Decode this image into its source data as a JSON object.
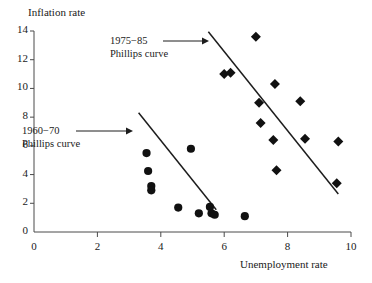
{
  "chart_data": {
    "type": "scatter",
    "title": "",
    "xlabel": "Unemployment rate",
    "ylabel": "Inflation rate",
    "xlim": [
      0,
      10
    ],
    "ylim": [
      0,
      14
    ],
    "xticks": [
      0,
      2,
      4,
      6,
      8,
      10
    ],
    "yticks": [
      0,
      2,
      4,
      6,
      8,
      10,
      12,
      14
    ],
    "xtick_labels": [
      "0",
      "2",
      "4",
      "6",
      "8",
      "10"
    ],
    "ytick_labels": [
      "0",
      "2",
      "4",
      "6",
      "8",
      "10",
      "12",
      "14"
    ],
    "grid": false,
    "legend": "none",
    "series": [
      {
        "name": "1960-70",
        "marker": "circle",
        "color": "#111111",
        "points": [
          {
            "x": 3.55,
            "y": 5.5
          },
          {
            "x": 3.6,
            "y": 4.25
          },
          {
            "x": 3.7,
            "y": 3.2
          },
          {
            "x": 3.7,
            "y": 2.9
          },
          {
            "x": 4.55,
            "y": 1.7
          },
          {
            "x": 4.95,
            "y": 5.8
          },
          {
            "x": 5.2,
            "y": 1.3
          },
          {
            "x": 5.55,
            "y": 1.75
          },
          {
            "x": 5.6,
            "y": 1.3
          },
          {
            "x": 5.7,
            "y": 1.2
          },
          {
            "x": 6.65,
            "y": 1.1
          }
        ]
      },
      {
        "name": "1975-85",
        "marker": "diamond",
        "color": "#111111",
        "points": [
          {
            "x": 6.0,
            "y": 11.0
          },
          {
            "x": 6.2,
            "y": 11.1
          },
          {
            "x": 7.0,
            "y": 13.6
          },
          {
            "x": 7.1,
            "y": 9.0
          },
          {
            "x": 7.15,
            "y": 7.6
          },
          {
            "x": 7.55,
            "y": 6.4
          },
          {
            "x": 7.6,
            "y": 10.3
          },
          {
            "x": 7.65,
            "y": 4.3
          },
          {
            "x": 8.4,
            "y": 9.1
          },
          {
            "x": 8.55,
            "y": 6.5
          },
          {
            "x": 9.6,
            "y": 6.3
          },
          {
            "x": 9.55,
            "y": 3.4
          }
        ]
      }
    ],
    "trend_lines": [
      {
        "name": "1960-70 Phillips curve",
        "x1": 3.3,
        "y1": 8.3,
        "x2": 5.75,
        "y2": 1.55
      },
      {
        "name": "1975-85 Phillips curve",
        "x1": 5.5,
        "y1": 13.95,
        "x2": 9.6,
        "y2": 2.65
      }
    ],
    "annotations": [
      {
        "name": "annotation-1975-85",
        "line1": "1975−85",
        "line2": "Phillips curve",
        "x_px": 110,
        "y_px": 34,
        "arrow": {
          "x1": 163,
          "y1": 41,
          "x2": 209,
          "y2": 41
        }
      },
      {
        "name": "annotation-1960-70",
        "line1": "1960−70",
        "line2": "Phillips curve",
        "x_px": 22,
        "y_px": 124,
        "arrow": {
          "x1": 76,
          "y1": 131,
          "x2": 133,
          "y2": 131
        }
      }
    ]
  },
  "colors": {
    "marker": "#111111",
    "axis": "#4a4a4a",
    "line": "#1d1d1d",
    "background": "#ffffff"
  }
}
